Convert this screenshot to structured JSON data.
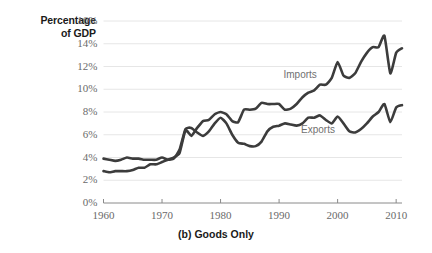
{
  "chart_data": {
    "type": "line",
    "title": "",
    "caption": "(b) Goods Only",
    "ylabel": "Percentage of GDP",
    "ylabel_line1": "Percentage",
    "ylabel_line2": "of GDP",
    "xlabel": "",
    "xlim": [
      1960,
      2011
    ],
    "ylim": [
      0,
      16
    ],
    "yticks": [
      0,
      2,
      4,
      6,
      8,
      10,
      12,
      14,
      16
    ],
    "ytick_labels": [
      "0%",
      "2%",
      "4%",
      "6%",
      "8%",
      "10%",
      "12%",
      "14%",
      "16%"
    ],
    "xticks": [
      1960,
      1970,
      1980,
      1990,
      2000,
      2010
    ],
    "xtick_labels": [
      "1960",
      "1970",
      "1980",
      "1990",
      "2000",
      "2010"
    ],
    "grid": "horizontal",
    "legend_position": "inline-annotations",
    "line_color": "#3c3c3c",
    "grid_color": "#e6e6e6",
    "axis_color": "#8a8a8a",
    "series": [
      {
        "name": "Imports",
        "label": "Imports",
        "x": [
          1960,
          1961,
          1962,
          1963,
          1964,
          1965,
          1966,
          1967,
          1968,
          1969,
          1970,
          1971,
          1972,
          1973,
          1974,
          1975,
          1976,
          1977,
          1978,
          1979,
          1980,
          1981,
          1982,
          1983,
          1984,
          1985,
          1986,
          1987,
          1988,
          1989,
          1990,
          1991,
          1992,
          1993,
          1994,
          1995,
          1996,
          1997,
          1998,
          1999,
          2000,
          2001,
          2002,
          2003,
          2004,
          2005,
          2006,
          2007,
          2008,
          2009,
          2010,
          2011
        ],
        "values": [
          2.8,
          2.7,
          2.8,
          2.8,
          2.8,
          2.9,
          3.1,
          3.1,
          3.4,
          3.4,
          3.6,
          3.8,
          4.0,
          4.4,
          6.4,
          5.9,
          6.6,
          7.2,
          7.3,
          7.8,
          8.0,
          7.8,
          7.2,
          7.1,
          8.2,
          8.2,
          8.3,
          8.8,
          8.7,
          8.7,
          8.7,
          8.2,
          8.3,
          8.7,
          9.3,
          9.7,
          9.9,
          10.4,
          10.4,
          11.0,
          12.4,
          11.2,
          11.0,
          11.4,
          12.4,
          13.2,
          13.7,
          13.7,
          14.7,
          11.4,
          13.2,
          13.6
        ]
      },
      {
        "name": "Exports",
        "label": "Exports",
        "x": [
          1960,
          1961,
          1962,
          1963,
          1964,
          1965,
          1966,
          1967,
          1968,
          1969,
          1970,
          1971,
          1972,
          1973,
          1974,
          1975,
          1976,
          1977,
          1978,
          1979,
          1980,
          1981,
          1982,
          1983,
          1984,
          1985,
          1986,
          1987,
          1988,
          1989,
          1990,
          1991,
          1992,
          1993,
          1994,
          1995,
          1996,
          1997,
          1998,
          1999,
          2000,
          2001,
          2002,
          2003,
          2004,
          2005,
          2006,
          2007,
          2008,
          2009,
          2010,
          2011
        ],
        "values": [
          3.9,
          3.8,
          3.7,
          3.8,
          4.0,
          3.9,
          3.9,
          3.8,
          3.8,
          3.8,
          4.0,
          3.8,
          3.9,
          4.7,
          6.5,
          6.6,
          6.2,
          5.9,
          6.3,
          7.0,
          7.5,
          7.0,
          6.0,
          5.3,
          5.2,
          5.0,
          5.0,
          5.4,
          6.3,
          6.7,
          6.8,
          7.0,
          6.9,
          6.8,
          7.0,
          7.5,
          7.5,
          7.7,
          7.3,
          7.0,
          7.6,
          7.0,
          6.3,
          6.2,
          6.5,
          7.0,
          7.6,
          8.0,
          8.7,
          7.1,
          8.4,
          8.6
        ]
      }
    ],
    "annotations": [
      {
        "text": "Imports",
        "x": 1994,
        "y": 11.2
      },
      {
        "text": "Exports",
        "x": 1997,
        "y": 6.3
      }
    ]
  }
}
